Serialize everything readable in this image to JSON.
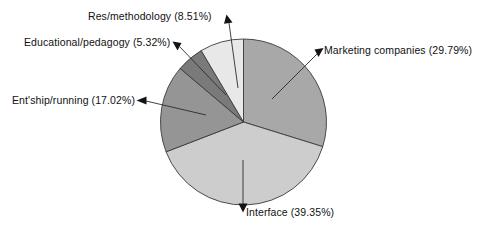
{
  "chart_data": {
    "type": "pie",
    "title": "",
    "subtitle": "",
    "xlabel": "",
    "ylabel": "",
    "legend_position": "none",
    "grid": false,
    "labels_position": "outside-with-leader-lines",
    "start_angle_deg": 0,
    "direction": "clockwise",
    "total_percent": "99.99%",
    "categories": [
      "Marketing companies",
      "Interface",
      "Ent'ship/running",
      "Educational/pedagogy",
      "Res/methodology"
    ],
    "values": [
      29.79,
      39.35,
      17.02,
      5.32,
      8.51
    ],
    "slices": [
      {
        "name": "Marketing companies",
        "value": 29.79,
        "percent_text": "(29.79%)",
        "label": "Marketing companies (29.79%)",
        "color": "#a8a8a8"
      },
      {
        "name": "Interface",
        "value": 39.35,
        "percent_text": "(39.35%)",
        "label": "Interface (39.35%)",
        "color": "#cdcdcd"
      },
      {
        "name": "Ent'ship/running",
        "value": 17.02,
        "percent_text": "(17.02%)",
        "label": "Ent'ship/running (17.02%)",
        "color": "#959595"
      },
      {
        "name": "Educational/pedagogy",
        "value": 5.32,
        "percent_text": "(5.32%)",
        "label": "Educational/pedagogy (5.32%)",
        "color": "#7a7a7a"
      },
      {
        "name": "Res/methodology",
        "value": 8.51,
        "percent_text": "(8.51%)",
        "label": "Res/methodology (8.51%)",
        "color": "#e8e8e8"
      }
    ],
    "colors": {
      "outline": "#3a3a3a",
      "leader_line": "#2b2b2b",
      "arrowhead": "#141414",
      "text": "#111111",
      "background": "#ffffff"
    }
  },
  "labels": {
    "marketing": "Marketing companies (29.79%)",
    "interface": "Interface (39.35%)",
    "entship": "Ent'ship/running (17.02%)",
    "educational": "Educational/pedagogy (5.32%)",
    "research": "Res/methodology (8.51%)"
  }
}
